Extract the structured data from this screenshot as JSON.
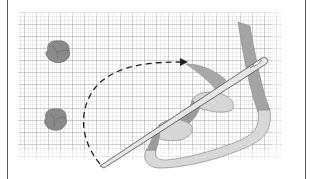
{
  "figure": {
    "background": "grid-fabric",
    "colors": {
      "grid_line": "#b8b8b8",
      "grid_line_strong": "#9a9a9a",
      "knot_fill": "#8a8a8a",
      "knot_shade": "#6e6e6e",
      "ribbon_light": "#d6d6d6",
      "ribbon_dark": "#9c9c9c",
      "ribbon_edge": "#8a8a8a",
      "needle_fill": "#e6e6e6",
      "needle_edge": "#5a5a5a",
      "dash_arrow": "#222222",
      "border": "#555555"
    },
    "elements": [
      {
        "name": "ribbon-knot-top",
        "type": "knot"
      },
      {
        "name": "ribbon-knot-bottom",
        "type": "knot"
      },
      {
        "name": "dashed-arc-arrow",
        "type": "arrow"
      },
      {
        "name": "ribbon",
        "type": "ribbon"
      },
      {
        "name": "needle",
        "type": "needle"
      }
    ]
  }
}
